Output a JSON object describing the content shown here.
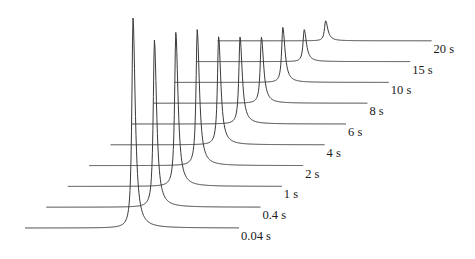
{
  "chart_data": {
    "type": "line",
    "subtype": "waterfall",
    "title": "",
    "xlabel": "",
    "ylabel": "",
    "grid": false,
    "legend": "none",
    "series": [
      {
        "name": "0.04 s",
        "label": "0.04 s",
        "peak_height": 210
      },
      {
        "name": "0.4 s",
        "label": "0.4 s",
        "peak_height": 167
      },
      {
        "name": "1 s",
        "label": "1 s",
        "peak_height": 154
      },
      {
        "name": "2 s",
        "label": "2 s",
        "peak_height": 136
      },
      {
        "name": "4 s",
        "label": "4 s",
        "peak_height": 108
      },
      {
        "name": "6 s",
        "label": "6 s",
        "peak_height": 87
      },
      {
        "name": "8 s",
        "label": "8 s",
        "peak_height": 66
      },
      {
        "name": "10 s",
        "label": "10 s",
        "peak_height": 55
      },
      {
        "name": "15 s",
        "label": "15 s",
        "peak_height": 32
      },
      {
        "name": "20 s",
        "label": "20 s",
        "peak_height": 20
      }
    ],
    "peak_height_units": "relative intensity (arbitrary)"
  }
}
